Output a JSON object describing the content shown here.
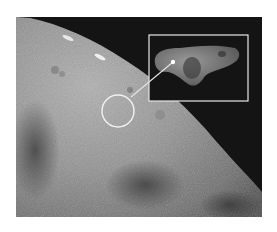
{
  "image": {
    "subject": "asteroid surface close-up with inset of whole asteroid",
    "colors": {
      "background": "#ffffff",
      "space": "#141414",
      "surface_light": "#a8a8a8",
      "surface_mid": "#8a8a8a",
      "surface_dark": "#555555",
      "annotation": "#f2f2f2"
    },
    "annotations": {
      "circle": {
        "cx": 118,
        "cy": 111,
        "r": 16
      },
      "inset_box": {
        "x": 149,
        "y": 35,
        "width": 99,
        "height": 66
      },
      "pointer_dot": {
        "x": 173,
        "y": 62
      }
    }
  }
}
